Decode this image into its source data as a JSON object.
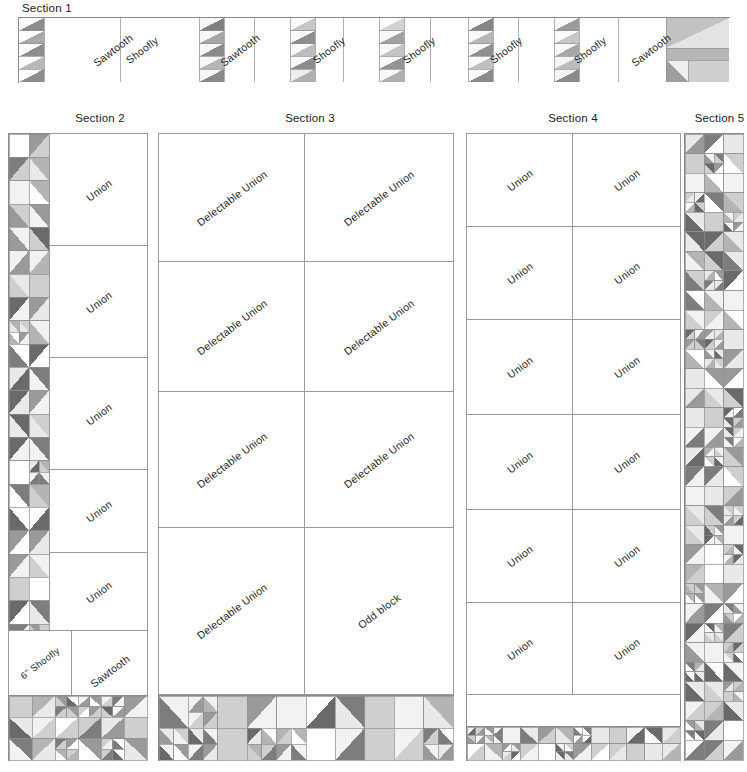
{
  "diagram": {
    "palette": {
      "white": "#ffffff",
      "light": "#e9e9e9",
      "light2": "#f2f2f2",
      "mid_light": "#cfcfcf",
      "mid": "#b4b4b4",
      "mid_dark": "#9a9a9a",
      "dark": "#7d7d7d",
      "darkest": "#6a6a6a",
      "outline": "#8a8a8a",
      "text": "#1b1b1b"
    },
    "sections": [
      {
        "id": "section-1",
        "label": "Section 1",
        "orientation": "horizontal",
        "blocks": [
          {
            "name": "Sawtooth"
          },
          {
            "name": "Shoofly"
          },
          {
            "name": "Sawtooth"
          },
          {
            "name": "Shoofly"
          },
          {
            "name": "Shoofly"
          },
          {
            "name": "Shoofly"
          },
          {
            "name": "Shoofly"
          },
          {
            "name": "Sawtooth"
          }
        ],
        "sashing": "pieced half-square-triangle strips between blocks",
        "end_unit": "pieced corner block"
      },
      {
        "id": "section-2",
        "label": "Section 2",
        "orientation": "vertical",
        "blocks": [
          {
            "name": "Union"
          },
          {
            "name": "Union"
          },
          {
            "name": "Union"
          },
          {
            "name": "Union"
          },
          {
            "name": "Union"
          }
        ],
        "lower_blocks": [
          {
            "name": "6\" Shoofly"
          },
          {
            "name": "Sawtooth"
          }
        ],
        "left_border": "two-column pieced half-square-triangle strip",
        "bottom_border": "pieced border strip"
      },
      {
        "id": "section-3",
        "label": "Section 3",
        "orientation": "grid",
        "columns": 2,
        "rows": 4,
        "blocks": [
          {
            "name": "Delectable Union"
          },
          {
            "name": "Delectable Union"
          },
          {
            "name": "Delectable Union"
          },
          {
            "name": "Delectable Union"
          },
          {
            "name": "Delectable Union"
          },
          {
            "name": "Delectable Union"
          },
          {
            "name": "Delectable Union"
          },
          {
            "name": "Odd block"
          }
        ],
        "bottom_border": "pieced border strip"
      },
      {
        "id": "section-4",
        "label": "Section 4",
        "orientation": "grid",
        "columns": 2,
        "rows": 6,
        "blocks": [
          {
            "name": "Union"
          },
          {
            "name": "Union"
          },
          {
            "name": "Union"
          },
          {
            "name": "Union"
          },
          {
            "name": "Union"
          },
          {
            "name": "Union"
          },
          {
            "name": "Union"
          },
          {
            "name": "Union"
          },
          {
            "name": "Union"
          },
          {
            "name": "Union"
          },
          {
            "name": "Union"
          },
          {
            "name": "Union"
          }
        ],
        "bottom_border": "pieced border strip"
      },
      {
        "id": "section-5",
        "label": "Section 5",
        "orientation": "vertical",
        "blocks": [],
        "description": "full-height three-column pieced half-square-triangle strip"
      }
    ]
  }
}
